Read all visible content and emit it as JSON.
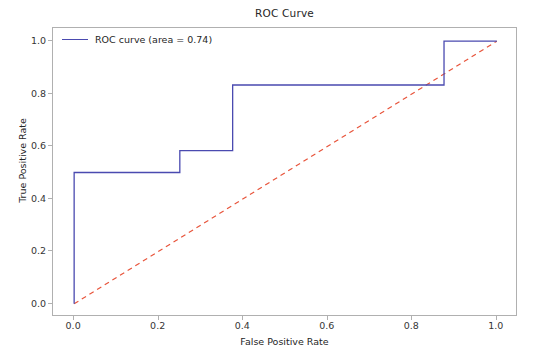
{
  "chart_data": {
    "type": "line",
    "title": "ROC Curve",
    "xlabel": "False Positive Rate",
    "ylabel": "True Positive Rate",
    "xlim": [
      -0.05,
      1.05
    ],
    "ylim": [
      -0.05,
      1.05
    ],
    "grid": false,
    "legend_position": "upper left",
    "xticks": [
      "0.0",
      "0.2",
      "0.4",
      "0.6",
      "0.8",
      "1.0"
    ],
    "xtick_values": [
      0.0,
      0.2,
      0.4,
      0.6,
      0.8,
      1.0
    ],
    "yticks": [
      "0.0",
      "0.2",
      "0.4",
      "0.6",
      "0.8",
      "1.0"
    ],
    "ytick_values": [
      0.0,
      0.2,
      0.4,
      0.6,
      0.8,
      1.0
    ],
    "auc": 0.74,
    "series": [
      {
        "name": "ROC curve (area = 0.74)",
        "style": "solid",
        "color": "#4a4ab0",
        "drawstyle": "steps-post",
        "x": [
          0.0,
          0.0,
          0.25,
          0.25,
          0.375,
          0.375,
          0.875,
          0.875,
          1.0
        ],
        "y": [
          0.0,
          0.5,
          0.5,
          0.583,
          0.583,
          0.833,
          0.833,
          1.0,
          1.0
        ]
      },
      {
        "name": "chance-diagonal",
        "style": "dashed",
        "color": "#e8553c",
        "x": [
          0.0,
          1.0
        ],
        "y": [
          0.0,
          1.0
        ]
      }
    ]
  },
  "legend": {
    "entries": [
      {
        "label": "ROC curve (area = 0.74)",
        "color": "#4a4ab0"
      }
    ]
  },
  "axes": {
    "frame_color": "#b0b0b0"
  }
}
